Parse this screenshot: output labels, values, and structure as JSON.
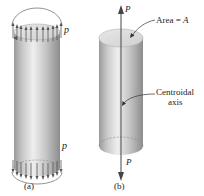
{
  "figure": {
    "panel_a": {
      "label": "(a)",
      "load_label_top": "p",
      "load_label_bottom": "p"
    },
    "panel_b": {
      "label": "(b)",
      "force_top": "P",
      "force_bottom": "P",
      "area_label": "Area = A",
      "axis_label_line1": "Centroidal",
      "axis_label_line2": "axis"
    },
    "colors": {
      "cylinder_light": "#e6e6e6",
      "cylinder_mid": "#bdbdbd",
      "cylinder_dark": "#8f8f8f",
      "top_face": "#dcdcdc",
      "arrow": "#555555",
      "axis_line": "#444444"
    }
  }
}
